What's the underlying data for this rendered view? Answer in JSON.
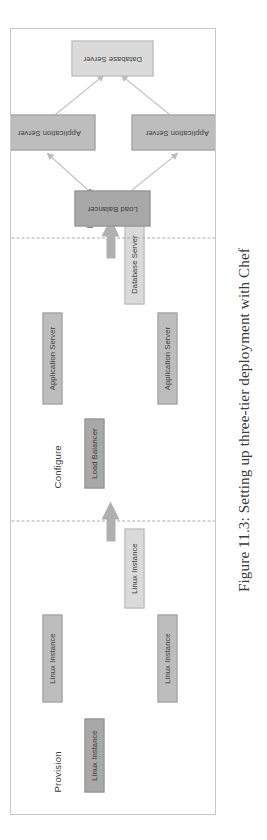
{
  "caption": "Figure 11.3: Setting up three-tier deployment with Chef",
  "colors": {
    "dark_node": "#a8a8a8",
    "mid_node": "#bdbdbd",
    "light_node": "#dadada",
    "node_border": "#9a9a9a",
    "frame_border": "#c9c9c9",
    "separator": "#aaaaaa",
    "arrow": "#b0b0b0",
    "connector": "#c0c0c0",
    "text": "#3d3d3d"
  },
  "diagram": {
    "title": "Three-tier deployment with Chef",
    "orientation": "rotated-90-counterclockwise",
    "stages": [
      {
        "id": "provision",
        "label": "Provision",
        "nodes": [
          {
            "id": "provision-lb",
            "label": "Linux Instance",
            "tone": "dark"
          },
          {
            "id": "provision-app1",
            "label": "Linux Instance",
            "tone": "mid"
          },
          {
            "id": "provision-app2",
            "label": "Linux Instance",
            "tone": "mid"
          },
          {
            "id": "provision-db",
            "label": "Linux Instance",
            "tone": "light"
          }
        ]
      },
      {
        "id": "configure",
        "label": "Configure",
        "nodes": [
          {
            "id": "configure-lb",
            "label": "Load Balancer",
            "tone": "dark"
          },
          {
            "id": "configure-app1",
            "label": "Application Server",
            "tone": "mid"
          },
          {
            "id": "configure-app2",
            "label": "Application Server",
            "tone": "mid"
          },
          {
            "id": "configure-db",
            "label": "Database Server",
            "tone": "light"
          }
        ]
      },
      {
        "id": "integrate",
        "label": "Integrate",
        "nodes": [
          {
            "id": "integrate-lb",
            "label": "Load Balancer",
            "tone": "dark"
          },
          {
            "id": "integrate-app1",
            "label": "Application Server",
            "tone": "mid"
          },
          {
            "id": "integrate-app2",
            "label": "Application Server",
            "tone": "mid"
          },
          {
            "id": "integrate-db",
            "label": "Database Server",
            "tone": "light"
          }
        ],
        "connections": [
          {
            "from": "integrate-lb",
            "to": "integrate-app1"
          },
          {
            "from": "integrate-lb",
            "to": "integrate-app2"
          },
          {
            "from": "integrate-app1",
            "to": "integrate-db"
          },
          {
            "from": "integrate-app2",
            "to": "integrate-db"
          }
        ]
      }
    ],
    "transitions": [
      {
        "id": "provision-to-configure",
        "icon": "up-arrow-icon",
        "direction": "up"
      },
      {
        "id": "configure-to-integrate",
        "icon": "up-arrow-icon",
        "direction": "up"
      }
    ]
  }
}
